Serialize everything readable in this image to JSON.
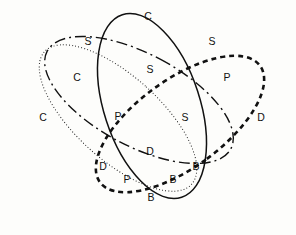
{
  "figure": {
    "type": "venn-diagram",
    "set_count": 4,
    "background_color": "#fdfdfb",
    "stroke_color": "#111111",
    "label_color": "#111111",
    "width": 296,
    "height": 235
  },
  "ellipses": [
    {
      "id": "ellipse-dotted",
      "line_style": "dotted",
      "cx": 118,
      "cy": 118,
      "rx": 42,
      "ry": 99,
      "rotation": -48,
      "stroke_width": 1.0,
      "dash": "0.9 2.2"
    },
    {
      "id": "ellipse-dashdot",
      "line_style": "dash-dot",
      "cx": 139,
      "cy": 100,
      "rx": 46,
      "ry": 104,
      "rotation": -62,
      "stroke_width": 1.4,
      "dash": "11 4 2 4"
    },
    {
      "id": "ellipse-solid",
      "line_style": "solid",
      "cx": 152,
      "cy": 106,
      "rx": 48,
      "ry": 96,
      "rotation": -18,
      "stroke_width": 1.5,
      "dash": "none"
    },
    {
      "id": "ellipse-heavy-dashed",
      "line_style": "heavy-dashed",
      "cx": 180,
      "cy": 124,
      "rx": 44,
      "ry": 99,
      "rotation": 54,
      "stroke_width": 2.6,
      "dash": "5 4"
    }
  ],
  "region_labels": [
    {
      "id": "label-c-top",
      "text": "C",
      "x": 148,
      "y": 17
    },
    {
      "id": "label-s-upper-left",
      "text": "S",
      "x": 88,
      "y": 42
    },
    {
      "id": "label-s-upper-right",
      "text": "S",
      "x": 212,
      "y": 42
    },
    {
      "id": "label-c-left-inner",
      "text": "C",
      "x": 77,
      "y": 78
    },
    {
      "id": "label-s-center-top",
      "text": "S",
      "x": 150,
      "y": 70
    },
    {
      "id": "label-p-right-upper",
      "text": "P",
      "x": 227,
      "y": 78
    },
    {
      "id": "label-c-far-left",
      "text": "C",
      "x": 43,
      "y": 118
    },
    {
      "id": "label-p-center-left",
      "text": "P",
      "x": 118,
      "y": 117
    },
    {
      "id": "label-s-center-right",
      "text": "S",
      "x": 185,
      "y": 118
    },
    {
      "id": "label-d-far-right",
      "text": "D",
      "x": 261,
      "y": 118
    },
    {
      "id": "label-d-center",
      "text": "D",
      "x": 150,
      "y": 152
    },
    {
      "id": "label-d-lower-left",
      "text": "D",
      "x": 103,
      "y": 167
    },
    {
      "id": "label-b-lower-right",
      "text": "B",
      "x": 196,
      "y": 167
    },
    {
      "id": "label-p-bottom",
      "text": "P",
      "x": 127,
      "y": 180
    },
    {
      "id": "label-b-mid-bottom",
      "text": "B",
      "x": 173,
      "y": 180
    },
    {
      "id": "label-b-bottom",
      "text": "B",
      "x": 151,
      "y": 198
    }
  ]
}
